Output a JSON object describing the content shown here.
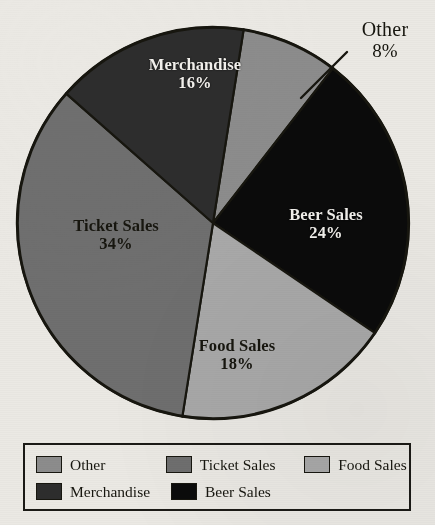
{
  "chart_data": {
    "type": "pie",
    "title": "",
    "categories": [
      "Other",
      "Beer Sales",
      "Food Sales",
      "Ticket Sales",
      "Merchandise"
    ],
    "values": [
      8,
      24,
      18,
      34,
      16
    ],
    "value_unit": "%",
    "start_angle_deg": 9,
    "direction": "clockwise",
    "legend_position": "bottom",
    "grid": false,
    "slices": [
      {
        "label": "Other",
        "value": 8,
        "value_text": "8%",
        "color": "#8c8c8c",
        "label_placement": "outside",
        "text_color": "#17160f"
      },
      {
        "label": "Beer Sales",
        "value": 24,
        "value_text": "24%",
        "color": "#0b0b0b",
        "label_placement": "inside",
        "text_color": "#f2f0ec"
      },
      {
        "label": "Food Sales",
        "value": 18,
        "value_text": "18%",
        "color": "#a9a9a9",
        "label_placement": "inside",
        "text_color": "#17160f"
      },
      {
        "label": "Ticket Sales",
        "value": 34,
        "value_text": "34%",
        "color": "#6f6f6f",
        "label_placement": "inside",
        "text_color": "#17160f"
      },
      {
        "label": "Merchandise",
        "value": 16,
        "value_text": "16%",
        "color": "#2d2d2d",
        "label_placement": "inside",
        "text_color": "#f2f0ec"
      }
    ]
  },
  "pie": {
    "labels": {
      "merchandise": {
        "name": "Merchandise",
        "pct": "16%"
      },
      "ticket": {
        "name": "Ticket Sales",
        "pct": "34%"
      },
      "beer": {
        "name": "Beer Sales",
        "pct": "24%"
      },
      "food": {
        "name": "Food Sales",
        "pct": "18%"
      },
      "other": {
        "name": "Other",
        "pct": "8%"
      }
    }
  },
  "legend": {
    "rows": [
      [
        {
          "label": "Other",
          "color": "#8c8c8c"
        },
        {
          "label": "Ticket Sales",
          "color": "#6f6f6f"
        },
        {
          "label": "Food Sales",
          "color": "#a9a9a9"
        }
      ],
      [
        {
          "label": "Merchandise",
          "color": "#2d2d2d"
        },
        {
          "label": "Beer Sales",
          "color": "#0b0b0b"
        }
      ]
    ]
  },
  "colors": {
    "background": "#ebe9e4",
    "outline": "#17160f",
    "other": "#8c8c8c",
    "ticket_sales": "#6f6f6f",
    "food_sales": "#a9a9a9",
    "merchandise": "#2d2d2d",
    "beer_sales": "#0b0b0b"
  }
}
